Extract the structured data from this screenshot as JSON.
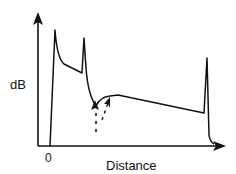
{
  "diagram": {
    "type": "OTDR trace (signal vs distance)",
    "y_axis_label": "dB",
    "x_axis_label": "Distance",
    "origin_label": "0",
    "features": [
      {
        "name": "initial-reflection-spike",
        "position": "near origin"
      },
      {
        "name": "second-reflection-spike",
        "position": "short distance"
      },
      {
        "name": "loss-dip",
        "position": "after second spike",
        "marked_by": "dashed arrows"
      },
      {
        "name": "linear-decay",
        "position": "middle section"
      },
      {
        "name": "end-reflection-spike",
        "position": "far end"
      }
    ],
    "colors": {
      "line": "#111111",
      "background": "#ffffff"
    }
  }
}
